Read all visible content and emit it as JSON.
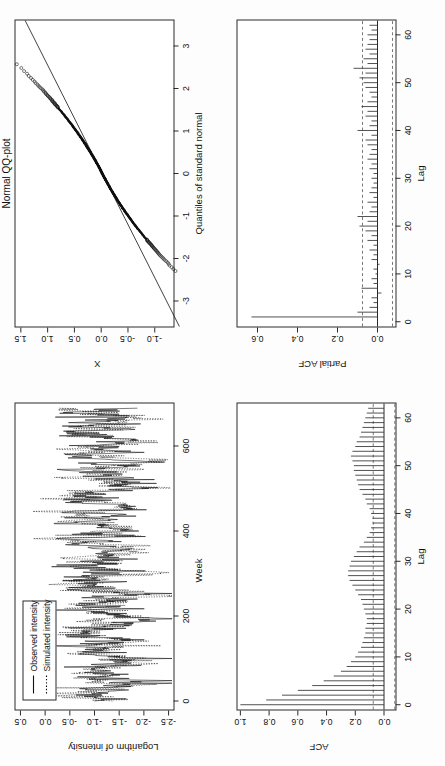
{
  "figure": {
    "background": "#fdfdfd",
    "foreground": "#1a1a1a",
    "orientation": "rotated-90-ccw",
    "panel_count": 4
  },
  "panels": {
    "timeseries": {
      "title": "",
      "xlabel": "Week",
      "ylabel": "Logarithm of intensity",
      "legend": {
        "items": [
          {
            "label": "Observed intensity",
            "style": "solid"
          },
          {
            "label": "Simulated intensity",
            "style": "dotted"
          }
        ]
      }
    },
    "qq": {
      "title": "Normal QQ-plot",
      "xlabel": "Quantiles of standard normal",
      "ylabel": "X"
    },
    "acf": {
      "title": "",
      "xlabel": "Lag",
      "ylabel": "ACF"
    },
    "pacf": {
      "title": "",
      "xlabel": "Lag",
      "ylabel": "Partial ACF"
    }
  },
  "chart_data": [
    {
      "id": "timeseries",
      "type": "line",
      "title": "",
      "xlabel": "Week",
      "ylabel": "Logarithm of intensity",
      "xlim": [
        -20,
        700
      ],
      "ylim": [
        -2.6,
        0.6
      ],
      "xticks": [
        0,
        200,
        400,
        600
      ],
      "yticks": [
        0.5,
        0.0,
        -0.5,
        -1.0,
        -1.5,
        -2.0,
        -2.5
      ],
      "xticklabels": [
        "0",
        "200",
        "400",
        "600"
      ],
      "yticklabels": [
        "0.5",
        "0.0",
        "-0.5",
        "-1.0",
        "-1.5",
        "-2.0",
        "-2.5"
      ],
      "grid": false,
      "legend_position": "top-left",
      "series": [
        {
          "name": "Observed intensity",
          "style": "solid",
          "color": "#111111",
          "n_points": 690,
          "mean": -1.22,
          "sd": 0.42,
          "seasonal_period": 52,
          "seasonal_amplitude": 0.3,
          "ar1": 0.62,
          "noise_sd": 0.33,
          "seed": 1729
        },
        {
          "name": "Simulated intensity",
          "style": "dotted",
          "color": "#111111",
          "n_points": 690,
          "mean": -1.18,
          "sd": 0.4,
          "seasonal_period": 52,
          "seasonal_amplitude": 0.28,
          "ar1": 0.6,
          "noise_sd": 0.32,
          "seed": 90210
        }
      ]
    },
    {
      "id": "qq",
      "type": "scatter",
      "title": "Normal QQ-plot",
      "xlabel": "Quantiles of standard normal",
      "ylabel": "X",
      "xlim": [
        -3.6,
        3.6
      ],
      "ylim": [
        -1.35,
        1.6
      ],
      "xticks": [
        -3,
        -2,
        -1,
        0,
        1,
        2,
        3
      ],
      "yticks": [
        1.5,
        1.0,
        0.5,
        0.0,
        -0.5,
        -1.0
      ],
      "xticklabels": [
        "-3",
        "-2",
        "-1",
        "0",
        "1",
        "2",
        "3"
      ],
      "yticklabels": [
        "1.5",
        "1.0",
        "0.5",
        "0.0",
        "-0.5",
        "-1.0"
      ],
      "grid": false,
      "n_points": 690,
      "reference_line": {
        "slope": 0.4,
        "intercept": -0.02,
        "style": "solid"
      },
      "tail_curvature": 0.085,
      "marker": "open-circle",
      "note": "S-shaped departure: both tails bend above the reference line"
    },
    {
      "id": "acf",
      "type": "bar",
      "title": "",
      "xlabel": "Lag",
      "ylabel": "ACF",
      "xlim": [
        -1,
        63
      ],
      "ylim": [
        -0.08,
        1.02
      ],
      "xticks": [
        0,
        10,
        20,
        30,
        40,
        50,
        60
      ],
      "yticks": [
        0.0,
        0.2,
        0.4,
        0.6,
        0.8,
        1.0
      ],
      "xticklabels": [
        "0",
        "10",
        "20",
        "30",
        "40",
        "50",
        "60"
      ],
      "yticklabels": [
        "0.0",
        "0.2",
        "0.4",
        "0.6",
        "0.8",
        "1.0"
      ],
      "grid": false,
      "conf_level": 0.075,
      "conf_style": "dashed",
      "lags": [
        0,
        1,
        2,
        3,
        4,
        5,
        6,
        7,
        8,
        9,
        10,
        11,
        12,
        13,
        14,
        15,
        16,
        17,
        18,
        19,
        20,
        21,
        22,
        23,
        24,
        25,
        26,
        27,
        28,
        29,
        30,
        31,
        32,
        33,
        34,
        35,
        36,
        37,
        38,
        39,
        40,
        41,
        42,
        43,
        44,
        45,
        46,
        47,
        48,
        49,
        50,
        51,
        52,
        53,
        54,
        55,
        56,
        57,
        58,
        59,
        60,
        61,
        62
      ],
      "values": [
        1.0,
        0.82,
        0.71,
        0.6,
        0.5,
        0.42,
        0.35,
        0.3,
        0.26,
        0.23,
        0.2,
        0.18,
        0.16,
        0.15,
        0.14,
        0.13,
        0.13,
        0.12,
        0.12,
        0.13,
        0.14,
        0.15,
        0.16,
        0.18,
        0.2,
        0.22,
        0.24,
        0.25,
        0.25,
        0.24,
        0.23,
        0.21,
        0.19,
        0.17,
        0.14,
        0.12,
        0.1,
        0.09,
        0.08,
        0.08,
        0.09,
        0.1,
        0.12,
        0.13,
        0.15,
        0.17,
        0.18,
        0.19,
        0.2,
        0.21,
        0.21,
        0.22,
        0.23,
        0.22,
        0.2,
        0.19,
        0.17,
        0.16,
        0.15,
        0.14,
        0.13,
        0.12,
        0.11
      ]
    },
    {
      "id": "pacf",
      "type": "bar",
      "title": "",
      "xlabel": "Lag",
      "ylabel": "Partial ACF",
      "xlim": [
        -1,
        63
      ],
      "ylim": [
        -0.09,
        0.7
      ],
      "xticks": [
        0,
        10,
        20,
        30,
        40,
        50,
        60
      ],
      "yticks": [
        0.0,
        0.2,
        0.4,
        0.6
      ],
      "xticklabels": [
        "0",
        "10",
        "20",
        "30",
        "40",
        "50",
        "60"
      ],
      "yticklabels": [
        "0.0",
        "0.2",
        "0.4",
        "0.6"
      ],
      "grid": false,
      "conf_level": 0.075,
      "conf_style": "dashed",
      "lags": [
        1,
        2,
        3,
        4,
        5,
        6,
        7,
        8,
        9,
        10,
        11,
        12,
        13,
        14,
        15,
        16,
        17,
        18,
        19,
        20,
        21,
        22,
        23,
        24,
        25,
        26,
        27,
        28,
        29,
        30,
        31,
        32,
        33,
        34,
        35,
        36,
        37,
        38,
        39,
        40,
        41,
        42,
        43,
        44,
        45,
        46,
        47,
        48,
        49,
        50,
        51,
        52,
        53,
        54,
        55,
        56,
        57,
        58,
        59,
        60,
        61,
        62
      ],
      "values": [
        0.63,
        0.1,
        0.04,
        0.02,
        0.03,
        -0.02,
        0.08,
        0.02,
        0.03,
        0.01,
        0.02,
        -0.01,
        0.03,
        0.02,
        0.04,
        0.02,
        0.05,
        0.03,
        0.06,
        0.09,
        0.05,
        0.1,
        0.04,
        0.03,
        0.05,
        0.02,
        0.04,
        0.03,
        0.02,
        0.03,
        0.02,
        0.04,
        0.03,
        0.05,
        0.04,
        0.03,
        0.05,
        0.06,
        0.03,
        0.1,
        0.04,
        0.03,
        0.06,
        0.05,
        0.08,
        0.05,
        0.03,
        0.04,
        0.06,
        0.07,
        0.09,
        0.06,
        0.12,
        0.05,
        0.07,
        0.04,
        0.06,
        0.05,
        0.04,
        0.05,
        0.03,
        0.04
      ]
    }
  ]
}
